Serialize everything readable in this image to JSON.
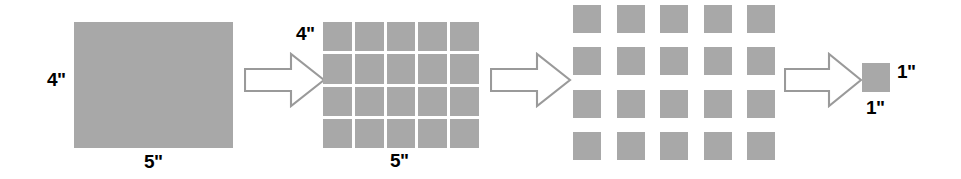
{
  "diagram": {
    "colors": {
      "block_fill": "#a8a8a8",
      "arrow_stroke": "#9a9a9a",
      "arrow_fill": "#ffffff",
      "label_text": "#000000",
      "background": "#ffffff"
    },
    "panels": [
      {
        "id": "whole-rectangle",
        "name": "Whole rectangle",
        "shape": "solid-rectangle",
        "height_label": "4\"",
        "width_label": "5\"",
        "rows": 1,
        "cols": 1
      },
      {
        "id": "tight-grid",
        "name": "Rectangle partitioned into unit squares",
        "shape": "grid",
        "height_label": "4\"",
        "width_label": "5\"",
        "rows": 4,
        "cols": 5,
        "square_count": 20
      },
      {
        "id": "spaced-grid",
        "name": "Unit squares separated",
        "shape": "grid",
        "height_label": "",
        "width_label": "",
        "rows": 4,
        "cols": 5,
        "square_count": 20
      },
      {
        "id": "unit-square",
        "name": "Single unit square",
        "shape": "solid-square",
        "height_label": "1\"",
        "width_label": "1\"",
        "rows": 1,
        "cols": 1
      }
    ],
    "arrows": [
      {
        "id": "arrow-1",
        "direction": "right"
      },
      {
        "id": "arrow-2",
        "direction": "right"
      },
      {
        "id": "arrow-3",
        "direction": "right"
      }
    ]
  }
}
